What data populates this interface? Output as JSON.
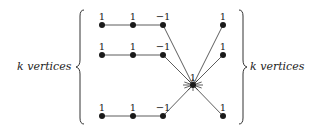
{
  "left_label": "k vertices",
  "right_label": "k vertices",
  "rows": [
    {
      "y": 25,
      "nodes": [
        {
          "x": 102,
          "label": "1"
        },
        {
          "x": 133,
          "label": "1"
        },
        {
          "x": 163,
          "label": "−1"
        }
      ],
      "right": {
        "x": 223,
        "label": "1"
      }
    },
    {
      "y": 55,
      "nodes": [
        {
          "x": 102,
          "label": "1"
        },
        {
          "x": 133,
          "label": "1"
        },
        {
          "x": 163,
          "label": "−1"
        }
      ],
      "right": {
        "x": 223,
        "label": "1"
      }
    },
    {
      "y": 116,
      "nodes": [
        {
          "x": 102,
          "label": "1"
        },
        {
          "x": 133,
          "label": "1"
        },
        {
          "x": 163,
          "label": "−1"
        }
      ],
      "right": {
        "x": 223,
        "label": "1"
      }
    }
  ],
  "center": {
    "x": 193,
    "y": 85,
    "label": "1"
  },
  "colors": {
    "node": "#1a1a1a",
    "edge": "#333333"
  }
}
